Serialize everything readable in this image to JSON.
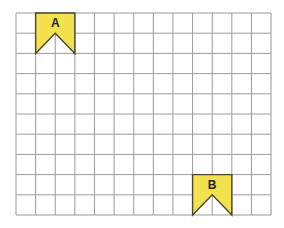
{
  "grid": {
    "columns": 13,
    "rows": 10,
    "origin_x": 16,
    "origin_y": 13,
    "cell_width": 19.62,
    "cell_height": 20.2,
    "line_color": "#9a9a9a",
    "border_color": "#8a8a8a"
  },
  "flags": [
    {
      "label": "A",
      "col": 1,
      "row": 0,
      "width_cells": 2,
      "height_cells": 2,
      "fill": "#f3e24d",
      "stroke": "#4a4433"
    },
    {
      "label": "B",
      "col": 9,
      "row": 8,
      "width_cells": 2,
      "height_cells": 2,
      "fill": "#f3e24d",
      "stroke": "#4a4433"
    }
  ]
}
